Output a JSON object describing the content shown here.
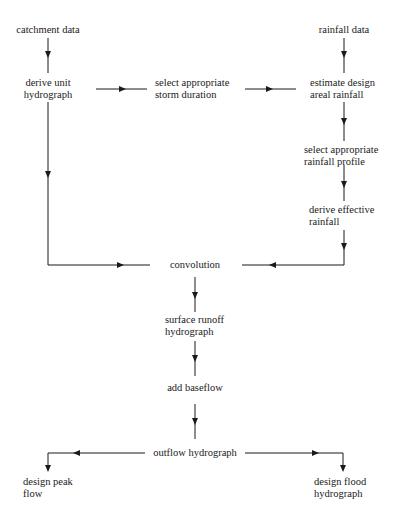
{
  "diagram": {
    "type": "flowchart",
    "nodes": {
      "catchment_data": {
        "lines": [
          "catchment data"
        ]
      },
      "rainfall_data": {
        "lines": [
          "rainfall data"
        ]
      },
      "derive_unit_hydrograph": {
        "lines": [
          "derive unit",
          "hydrograph"
        ]
      },
      "select_storm_duration": {
        "lines": [
          "select appropriate",
          "storm duration"
        ]
      },
      "estimate_areal_rainfall": {
        "lines": [
          "estimate design",
          "areal rainfall"
        ]
      },
      "select_rainfall_profile": {
        "lines": [
          "select appropriate",
          "rainfall profile"
        ]
      },
      "derive_effective_rainfall": {
        "lines": [
          "derive effective",
          "rainfall"
        ]
      },
      "convolution": {
        "lines": [
          "convolution"
        ]
      },
      "surface_runoff_hydrograph": {
        "lines": [
          "surface runoff",
          "hydrograph"
        ]
      },
      "add_baseflow": {
        "lines": [
          "add baseflow"
        ]
      },
      "outflow_hydrograph": {
        "lines": [
          "outflow hydrograph"
        ]
      },
      "design_peak_flow": {
        "lines": [
          "design peak",
          "flow"
        ]
      },
      "design_flood_hydrograph": {
        "lines": [
          "design flood",
          "hydrograph"
        ]
      }
    },
    "edges": [
      {
        "from": "catchment_data",
        "to": "derive_unit_hydrograph"
      },
      {
        "from": "derive_unit_hydrograph",
        "to": "select_storm_duration"
      },
      {
        "from": "select_storm_duration",
        "to": "estimate_areal_rainfall"
      },
      {
        "from": "rainfall_data",
        "to": "estimate_areal_rainfall"
      },
      {
        "from": "estimate_areal_rainfall",
        "to": "select_rainfall_profile"
      },
      {
        "from": "select_rainfall_profile",
        "to": "derive_effective_rainfall"
      },
      {
        "from": "derive_unit_hydrograph",
        "to": "convolution"
      },
      {
        "from": "derive_effective_rainfall",
        "to": "convolution"
      },
      {
        "from": "convolution",
        "to": "surface_runoff_hydrograph"
      },
      {
        "from": "surface_runoff_hydrograph",
        "to": "add_baseflow"
      },
      {
        "from": "add_baseflow",
        "to": "outflow_hydrograph"
      },
      {
        "from": "outflow_hydrograph",
        "to": "design_peak_flow"
      },
      {
        "from": "outflow_hydrograph",
        "to": "design_flood_hydrograph"
      }
    ],
    "colors": {
      "ink": "#1a1a1a",
      "background": "#ffffff"
    }
  }
}
